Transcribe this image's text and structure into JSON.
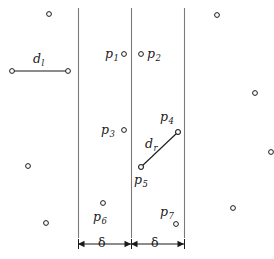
{
  "figure": {
    "width": 274,
    "height": 259,
    "background": "#ffffff",
    "ink": "#1a1a1a",
    "line_color": "#7a7a7a"
  },
  "vertical_lines": [
    {
      "name": "left-strip-boundary",
      "x": 78,
      "y1": 8,
      "y2": 238
    },
    {
      "name": "dividing-line",
      "x": 131,
      "y1": 8,
      "y2": 238
    },
    {
      "name": "right-strip-boundary",
      "x": 184,
      "y1": 8,
      "y2": 238
    }
  ],
  "labeled_points": [
    {
      "id": "p1",
      "label": "p",
      "sub": "1",
      "cx": 124,
      "cy": 54,
      "label_x": 105,
      "label_y": 48
    },
    {
      "id": "p2",
      "label": "p",
      "sub": "2",
      "cx": 141,
      "cy": 54,
      "label_x": 147,
      "label_y": 48
    },
    {
      "id": "p3",
      "label": "p",
      "sub": "3",
      "cx": 124,
      "cy": 130,
      "label_x": 101,
      "label_y": 124
    },
    {
      "id": "p4",
      "label": "p",
      "sub": "4",
      "cx": 178,
      "cy": 132,
      "label_x": 160,
      "label_y": 111
    },
    {
      "id": "p5",
      "label": "p",
      "sub": "5",
      "cx": 141,
      "cy": 167,
      "label_x": 134,
      "label_y": 174
    },
    {
      "id": "p6",
      "label": "p",
      "sub": "6",
      "cx": 103,
      "cy": 203,
      "label_x": 93,
      "label_y": 211
    },
    {
      "id": "p7",
      "label": "p",
      "sub": "7",
      "cx": 176,
      "cy": 224,
      "label_x": 160,
      "label_y": 206
    }
  ],
  "distance_segments": [
    {
      "id": "dl",
      "label": "d",
      "sub": "l",
      "x1": 12,
      "y1": 71,
      "x2": 68,
      "y2": 71,
      "label_x": 33,
      "label_y": 53
    },
    {
      "id": "dr",
      "label": "d",
      "sub": "r",
      "x1": 141,
      "y1": 167,
      "x2": 178,
      "y2": 132,
      "label_x": 145,
      "label_y": 138
    }
  ],
  "scatter_points": [
    {
      "cx": 49,
      "cy": 14
    },
    {
      "cx": 28,
      "cy": 166
    },
    {
      "cx": 46,
      "cy": 223
    },
    {
      "cx": 217,
      "cy": 15
    },
    {
      "cx": 255,
      "cy": 93
    },
    {
      "cx": 271,
      "cy": 152
    },
    {
      "cx": 233,
      "cy": 208
    }
  ],
  "measure_bar": {
    "y": 244,
    "left_span": {
      "name": "delta-left",
      "x1": 78,
      "x2": 131,
      "label": "δ",
      "label_x": 98,
      "label_y": 237
    },
    "right_span": {
      "name": "delta-right",
      "x1": 131,
      "x2": 184,
      "label": "δ",
      "label_x": 151,
      "label_y": 237
    }
  }
}
